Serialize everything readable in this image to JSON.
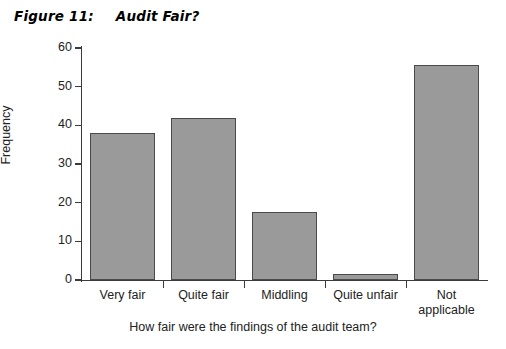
{
  "figure": {
    "number_label": "Figure 11:",
    "title": "Audit Fair?"
  },
  "chart_data": {
    "type": "bar",
    "title": "Audit Fair?",
    "xlabel": "How fair were the findings of the audit team?",
    "ylabel": "Frequency",
    "categories": [
      "Very fair",
      "Quite fair",
      "Middling",
      "Quite unfair",
      "Not applicable"
    ],
    "category_lines": [
      [
        "Very fair"
      ],
      [
        "Quite fair"
      ],
      [
        "Middling"
      ],
      [
        "Quite unfair"
      ],
      [
        "Not",
        "applicable"
      ]
    ],
    "values": [
      38,
      42,
      17.5,
      1.5,
      55.5
    ],
    "ylim": [
      0,
      60
    ],
    "yticks": [
      0,
      10,
      20,
      30,
      40,
      50,
      60
    ],
    "ytick_labels": [
      "0",
      "10",
      "20",
      "30",
      "40",
      "50",
      "60"
    ],
    "grid": false,
    "legend": null,
    "bar_color": "#9a9a9a",
    "bar_edge_color": "#4a4a4a",
    "axis_color": "#3b3b3b"
  }
}
